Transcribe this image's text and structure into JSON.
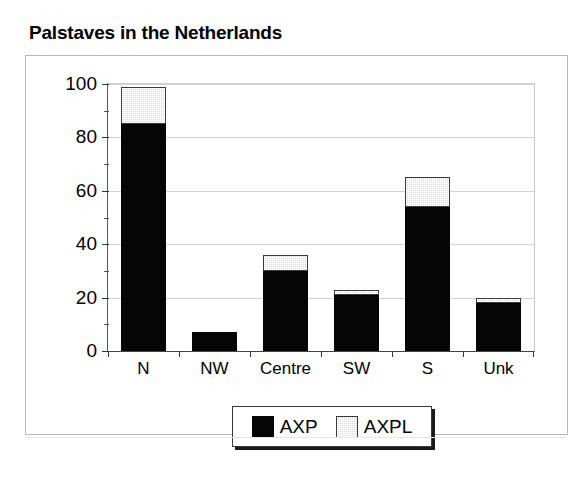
{
  "chart_data": {
    "type": "bar",
    "subtype": "stacked",
    "title": "Palstaves in the Netherlands",
    "xlabel": "",
    "ylabel": "",
    "categories": [
      "N",
      "NW",
      "Centre",
      "SW",
      "S",
      "Unk"
    ],
    "series": [
      {
        "name": "AXP",
        "color": "#050505",
        "values": [
          85,
          7,
          30,
          21,
          54,
          18
        ]
      },
      {
        "name": "AXPL",
        "color": "#d8d8d8",
        "values": [
          14,
          0,
          6,
          2,
          11,
          2
        ]
      }
    ],
    "totals": [
      99,
      7,
      36,
      23,
      65,
      20
    ],
    "ylim": [
      0,
      100
    ],
    "ytick_labels": [
      "0",
      "20",
      "40",
      "60",
      "80",
      "100"
    ],
    "ytick_values": [
      0,
      20,
      40,
      60,
      80,
      100
    ],
    "yminor_values": [
      10,
      30,
      50,
      70,
      90
    ],
    "grid": "horizontal",
    "legend_position": "bottom-center",
    "legend_entries": [
      "AXP",
      "AXPL"
    ]
  },
  "legend": {
    "items": [
      {
        "label": "AXP",
        "swatch": "black-square-swatch"
      },
      {
        "label": "AXPL",
        "swatch": "gray-dotted-square-swatch"
      }
    ]
  }
}
